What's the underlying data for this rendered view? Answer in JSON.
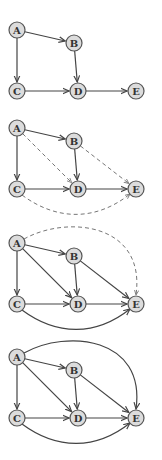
{
  "background": "#ffffff",
  "colors": {
    "node_fill": "#dcdcdc",
    "node_stroke": "#555555",
    "edge": "#444444",
    "edge_dashed": "#666666"
  },
  "nodes": [
    {
      "id": "A",
      "label": "A",
      "x": 17,
      "y": 0
    },
    {
      "id": "B",
      "label": "B",
      "x": 74,
      "y": 13
    },
    {
      "id": "C",
      "label": "C",
      "x": 17,
      "y": 61
    },
    {
      "id": "D",
      "label": "D",
      "x": 78,
      "y": 61
    },
    {
      "id": "E",
      "label": "E",
      "x": 136,
      "y": 61
    }
  ],
  "panels": [
    {
      "name": "graph-1",
      "offset_y": 30,
      "edges": [
        {
          "from": "A",
          "to": "B",
          "style": "solid"
        },
        {
          "from": "A",
          "to": "C",
          "style": "solid"
        },
        {
          "from": "B",
          "to": "D",
          "style": "solid"
        },
        {
          "from": "C",
          "to": "D",
          "style": "solid"
        },
        {
          "from": "D",
          "to": "E",
          "style": "solid"
        }
      ]
    },
    {
      "name": "graph-2",
      "offset_y": 128,
      "edges": [
        {
          "from": "A",
          "to": "B",
          "style": "solid"
        },
        {
          "from": "A",
          "to": "C",
          "style": "solid"
        },
        {
          "from": "B",
          "to": "D",
          "style": "solid"
        },
        {
          "from": "C",
          "to": "D",
          "style": "solid"
        },
        {
          "from": "D",
          "to": "E",
          "style": "solid"
        },
        {
          "from": "A",
          "to": "D",
          "style": "dashed"
        },
        {
          "from": "B",
          "to": "E",
          "style": "dashed"
        },
        {
          "from": "C",
          "to": "E",
          "style": "dashed",
          "curve": "below"
        }
      ]
    },
    {
      "name": "graph-3",
      "offset_y": 243,
      "edges": [
        {
          "from": "A",
          "to": "B",
          "style": "solid"
        },
        {
          "from": "A",
          "to": "C",
          "style": "solid"
        },
        {
          "from": "B",
          "to": "D",
          "style": "solid"
        },
        {
          "from": "C",
          "to": "D",
          "style": "solid"
        },
        {
          "from": "D",
          "to": "E",
          "style": "solid"
        },
        {
          "from": "A",
          "to": "D",
          "style": "solid"
        },
        {
          "from": "B",
          "to": "E",
          "style": "solid"
        },
        {
          "from": "C",
          "to": "E",
          "style": "solid",
          "curve": "below"
        },
        {
          "from": "A",
          "to": "E",
          "style": "dashed",
          "curve": "above"
        }
      ]
    },
    {
      "name": "graph-4",
      "offset_y": 357,
      "edges": [
        {
          "from": "A",
          "to": "B",
          "style": "solid"
        },
        {
          "from": "A",
          "to": "C",
          "style": "solid"
        },
        {
          "from": "B",
          "to": "D",
          "style": "solid"
        },
        {
          "from": "C",
          "to": "D",
          "style": "solid"
        },
        {
          "from": "D",
          "to": "E",
          "style": "solid"
        },
        {
          "from": "A",
          "to": "D",
          "style": "solid"
        },
        {
          "from": "B",
          "to": "E",
          "style": "solid"
        },
        {
          "from": "C",
          "to": "E",
          "style": "solid",
          "curve": "below"
        },
        {
          "from": "A",
          "to": "E",
          "style": "solid",
          "curve": "above"
        }
      ]
    }
  ]
}
